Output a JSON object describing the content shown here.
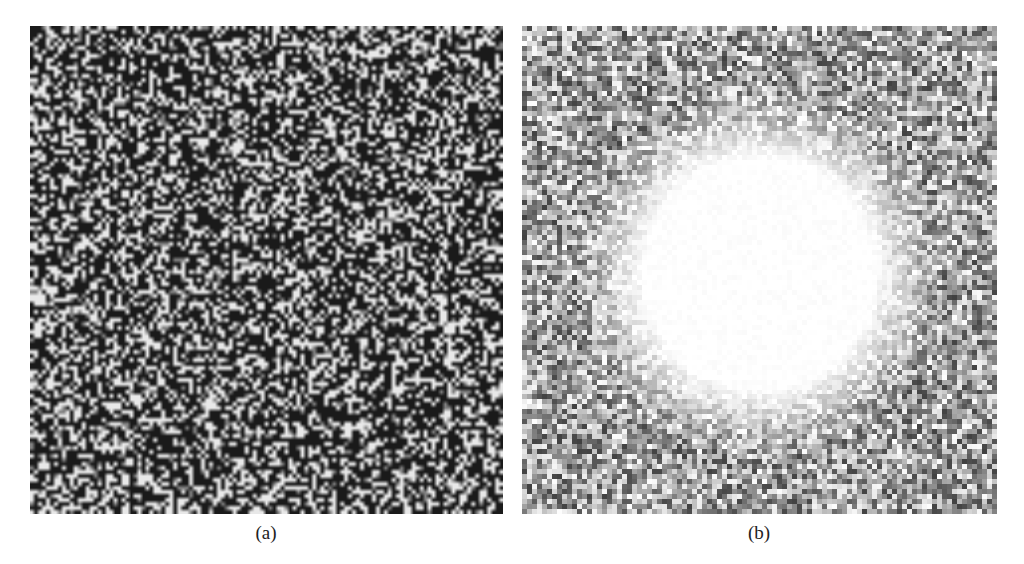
{
  "figure": {
    "panels": [
      {
        "id": "a",
        "label": "(a)",
        "description": "high-contrast random binary speckle pattern",
        "cell_px": 4,
        "dark_fraction": 0.58,
        "dark_color": "#1a1a1a",
        "light_color": "#e8e8e8"
      },
      {
        "id": "b",
        "label": "(b)",
        "description": "grayscale noise with bright circular spot in center",
        "cell_px": 5,
        "noise_mean": 160,
        "noise_spread": 95,
        "spot_center_rel": [
          0.5,
          0.51
        ],
        "spot_radius_px": 115,
        "spot_falloff_px": 70
      }
    ]
  }
}
